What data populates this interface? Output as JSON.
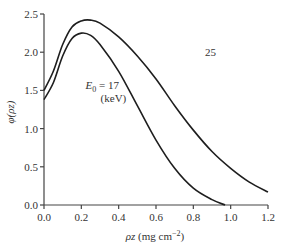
{
  "chart_data": {
    "type": "line",
    "title": "",
    "xlabel": "ρz (mg cm⁻²)",
    "xlabel_parts": {
      "var": "ρz",
      "unit_pre": "(mg cm",
      "sup": "−2",
      "unit_post": ")"
    },
    "ylabel": "φ(ρz)",
    "xlim": [
      0.0,
      1.2
    ],
    "ylim": [
      0.0,
      2.5
    ],
    "xticks": [
      "0.0",
      "0.2",
      "0.4",
      "0.6",
      "0.8",
      "1.0",
      "1.2"
    ],
    "yticks": [
      "0.0",
      "0.5",
      "1.0",
      "1.5",
      "2.0",
      "2.5"
    ],
    "grid": false,
    "legend": "inline annotations",
    "annotations": [
      {
        "text": "25",
        "x": 0.82,
        "y": 2.0,
        "series": "25 keV"
      },
      {
        "text_main": "E",
        "text_sub": "0",
        "text_rest": " = 17",
        "text_unit": "(keV)",
        "x": 0.33,
        "y": 1.55,
        "series": "17 keV"
      }
    ],
    "series": [
      {
        "name": "E0 = 25 keV",
        "x": [
          0.0,
          0.05,
          0.1,
          0.15,
          0.2,
          0.25,
          0.3,
          0.4,
          0.5,
          0.6,
          0.7,
          0.8,
          0.9,
          1.0,
          1.1,
          1.2
        ],
        "y": [
          1.5,
          1.75,
          2.1,
          2.33,
          2.41,
          2.42,
          2.38,
          2.2,
          1.95,
          1.65,
          1.3,
          0.98,
          0.7,
          0.48,
          0.3,
          0.17
        ]
      },
      {
        "name": "E0 = 17 keV",
        "x": [
          0.0,
          0.05,
          0.1,
          0.15,
          0.2,
          0.25,
          0.3,
          0.4,
          0.5,
          0.6,
          0.7,
          0.8,
          0.9,
          0.97
        ],
        "y": [
          1.38,
          1.6,
          1.95,
          2.18,
          2.25,
          2.22,
          2.1,
          1.75,
          1.3,
          0.85,
          0.48,
          0.22,
          0.07,
          0.0
        ]
      }
    ]
  },
  "axes": {
    "y_label_phi": "φ(ρz)"
  }
}
